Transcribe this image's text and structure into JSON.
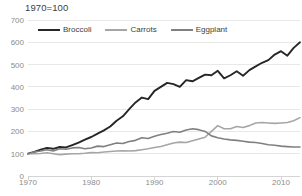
{
  "chart_data": {
    "type": "line",
    "title": "1970=100",
    "xlabel": "",
    "ylabel": "",
    "xlim": [
      1970,
      2013
    ],
    "ylim": [
      0,
      700
    ],
    "ytick_values": [
      0,
      100,
      200,
      300,
      400,
      500,
      600,
      700
    ],
    "ytick_labels": [
      "0",
      "100",
      "200",
      "300",
      "400",
      "500",
      "600",
      "700"
    ],
    "xtick_values": [
      1970,
      1980,
      1990,
      2000,
      2010
    ],
    "xtick_labels": [
      "1970",
      "1980",
      "1990",
      "2000",
      "2010"
    ],
    "grid": true,
    "legend_position": "top-left",
    "x": [
      1970,
      1971,
      1972,
      1973,
      1974,
      1975,
      1976,
      1977,
      1978,
      1979,
      1980,
      1981,
      1982,
      1983,
      1984,
      1985,
      1986,
      1987,
      1988,
      1989,
      1990,
      1991,
      1992,
      1993,
      1994,
      1995,
      1996,
      1997,
      1998,
      1999,
      2000,
      2001,
      2002,
      2003,
      2004,
      2005,
      2006,
      2007,
      2008,
      2009,
      2010,
      2011,
      2012,
      2013
    ],
    "series": [
      {
        "name": "Broccoli",
        "color": "#262626",
        "values": [
          100,
          108,
          118,
          126,
          122,
          130,
          128,
          139,
          150,
          163,
          175,
          190,
          205,
          222,
          248,
          268,
          300,
          330,
          352,
          345,
          382,
          400,
          418,
          412,
          400,
          430,
          425,
          440,
          455,
          452,
          472,
          438,
          452,
          470,
          450,
          475,
          492,
          508,
          520,
          545,
          560,
          540,
          575,
          600
        ]
      },
      {
        "name": "Carrots",
        "color": "#a6a6a6",
        "values": [
          100,
          100,
          101,
          104,
          100,
          96,
          98,
          100,
          100,
          102,
          105,
          104,
          108,
          110,
          112,
          113,
          112,
          114,
          118,
          122,
          128,
          132,
          140,
          148,
          152,
          150,
          158,
          166,
          174,
          200,
          226,
          212,
          212,
          222,
          218,
          226,
          238,
          240,
          238,
          236,
          238,
          240,
          248,
          262
        ]
      },
      {
        "name": "Eggplant",
        "color": "#808080",
        "values": [
          100,
          108,
          112,
          118,
          112,
          122,
          120,
          126,
          128,
          122,
          126,
          134,
          132,
          140,
          148,
          146,
          155,
          160,
          172,
          168,
          178,
          186,
          192,
          200,
          196,
          206,
          212,
          208,
          200,
          180,
          172,
          166,
          162,
          160,
          156,
          152,
          150,
          146,
          140,
          138,
          134,
          132,
          130,
          130
        ]
      }
    ]
  }
}
